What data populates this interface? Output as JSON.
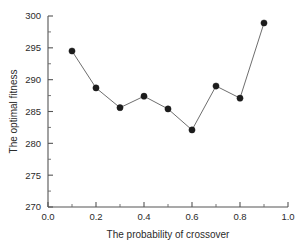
{
  "chart_data": {
    "type": "line",
    "title": "",
    "xlabel": "The probability of crossover",
    "ylabel": "The optimal fitness",
    "x": [
      0.1,
      0.2,
      0.3,
      0.4,
      0.5,
      0.6,
      0.7,
      0.8,
      0.9
    ],
    "values": [
      294.5,
      288.7,
      285.6,
      287.4,
      285.4,
      282.1,
      289.0,
      287.1,
      298.9
    ],
    "series": [
      {
        "name": "The optimal fitness",
        "values": [
          294.5,
          288.7,
          285.6,
          287.4,
          285.4,
          282.1,
          289.0,
          287.1,
          298.9
        ]
      }
    ],
    "xlim": [
      0.0,
      1.0
    ],
    "ylim": [
      270,
      300
    ],
    "xticks": [
      0.0,
      0.2,
      0.4,
      0.6,
      0.8,
      1.0
    ],
    "xtick_labels": [
      "0.0",
      "0.2",
      "0.4",
      "0.6",
      "0.8",
      "1.0"
    ],
    "xminor_ticks": [
      0.1,
      0.3,
      0.5,
      0.7,
      0.9
    ],
    "yticks": [
      270,
      275,
      280,
      285,
      290,
      295,
      300
    ],
    "ytick_labels": [
      "270",
      "275",
      "280",
      "285",
      "290",
      "295",
      "300"
    ],
    "yminor_ticks": [
      272.5,
      277.5,
      282.5,
      287.5,
      292.5,
      297.5
    ],
    "grid": false,
    "legend": false,
    "legend_position": "none",
    "marker": "filled-circle",
    "marker_color": "#1c1c1c",
    "line_color": "#6e6e6e",
    "background_color": "#ffffff",
    "axis_color": "#555555"
  }
}
